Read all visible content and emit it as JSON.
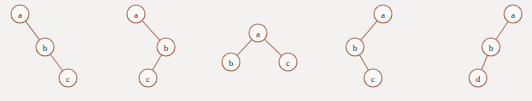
{
  "figure": {
    "name": "binary-tree-shapes-figure",
    "background_color": "#f3f2f0",
    "node_fill_color": "#faf9f7",
    "node_stroke_color": "#a8674f",
    "edge_color": "#b07a62",
    "label_color": "#2c3040",
    "node_radius": 9,
    "width": 532,
    "height": 101
  },
  "trees": [
    {
      "id": "tree-1",
      "offset_x": 0,
      "nodes": [
        {
          "label": "a",
          "x": 20,
          "y": 14
        },
        {
          "label": "b",
          "x": 45,
          "y": 47
        },
        {
          "label": "c",
          "x": 68,
          "y": 78
        }
      ],
      "edges": [
        {
          "from": 0,
          "to": 1
        },
        {
          "from": 1,
          "to": 2
        }
      ]
    },
    {
      "id": "tree-2",
      "offset_x": 0,
      "nodes": [
        {
          "label": "a",
          "x": 136,
          "y": 14
        },
        {
          "label": "b",
          "x": 166,
          "y": 47
        },
        {
          "label": "c",
          "x": 148,
          "y": 78
        }
      ],
      "edges": [
        {
          "from": 0,
          "to": 1
        },
        {
          "from": 1,
          "to": 2
        }
      ]
    },
    {
      "id": "tree-3",
      "offset_x": 0,
      "nodes": [
        {
          "label": "a",
          "x": 258,
          "y": 33
        },
        {
          "label": "b",
          "x": 231,
          "y": 62
        },
        {
          "label": "c",
          "x": 288,
          "y": 62
        }
      ],
      "edges": [
        {
          "from": 0,
          "to": 1
        },
        {
          "from": 0,
          "to": 2
        }
      ]
    },
    {
      "id": "tree-4",
      "offset_x": 0,
      "nodes": [
        {
          "label": "a",
          "x": 383,
          "y": 14
        },
        {
          "label": "b",
          "x": 355,
          "y": 47
        },
        {
          "label": "c",
          "x": 373,
          "y": 78
        }
      ],
      "edges": [
        {
          "from": 0,
          "to": 1
        },
        {
          "from": 1,
          "to": 2
        }
      ]
    },
    {
      "id": "tree-5",
      "offset_x": 0,
      "nodes": [
        {
          "label": "a",
          "x": 513,
          "y": 14
        },
        {
          "label": "b",
          "x": 491,
          "y": 47
        },
        {
          "label": "d",
          "x": 478,
          "y": 78
        }
      ],
      "edges": [
        {
          "from": 0,
          "to": 1
        },
        {
          "from": 1,
          "to": 2
        }
      ]
    }
  ]
}
